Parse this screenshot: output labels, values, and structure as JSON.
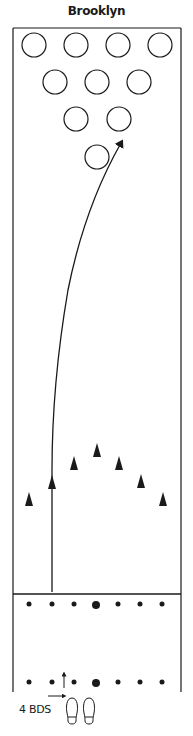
{
  "title": "Brooklyn",
  "lane": {
    "left_x": 13,
    "right_x": 181,
    "top_y": 28,
    "foul_line_y": 594,
    "approach_end_y": 692,
    "stroke_color": "#1a1a1a"
  },
  "pins": [
    {
      "id": 7,
      "x": 34,
      "y": 45
    },
    {
      "id": 8,
      "x": 76,
      "y": 45
    },
    {
      "id": 9,
      "x": 118,
      "y": 45
    },
    {
      "id": 10,
      "x": 160,
      "y": 45
    },
    {
      "id": 4,
      "x": 55,
      "y": 82
    },
    {
      "id": 5,
      "x": 97,
      "y": 82
    },
    {
      "id": 6,
      "x": 139,
      "y": 82
    },
    {
      "id": 2,
      "x": 76,
      "y": 119
    },
    {
      "id": 3,
      "x": 119,
      "y": 119
    },
    {
      "id": 1,
      "x": 97,
      "y": 157
    }
  ],
  "pin_radius": 12,
  "target_arrows": [
    {
      "x": 29,
      "y": 500
    },
    {
      "x": 52,
      "y": 483
    },
    {
      "x": 74,
      "y": 464
    },
    {
      "x": 97,
      "y": 451
    },
    {
      "x": 119,
      "y": 464
    },
    {
      "x": 141,
      "y": 482
    },
    {
      "x": 163,
      "y": 500
    }
  ],
  "foul_line_dots": [
    {
      "x": 29,
      "r": 2.5
    },
    {
      "x": 52,
      "r": 2.5
    },
    {
      "x": 74,
      "r": 2.5
    },
    {
      "x": 96,
      "r": 4
    },
    {
      "x": 118,
      "r": 2.5
    },
    {
      "x": 140,
      "r": 2.5
    },
    {
      "x": 162,
      "r": 2.5
    }
  ],
  "foul_line_dots_y": 604,
  "approach_dots_y": 682,
  "ball_path": {
    "start": {
      "x": 52,
      "y": 592
    },
    "end": {
      "x": 122,
      "y": 140
    },
    "description": "Ball path from approach straight up then curving into the 1-3 pocket"
  },
  "stance_marker": {
    "label": "4 BDS",
    "shoe_left_x": 72,
    "shoe_right_x": 89,
    "shoe_top_y": 697
  }
}
